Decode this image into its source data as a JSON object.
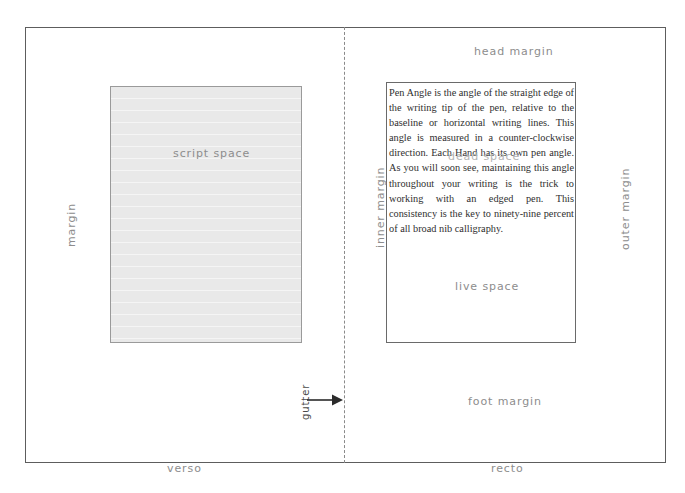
{
  "diagram": {
    "pages": {
      "verso_label": "verso",
      "recto_label": "recto"
    },
    "blocks": {
      "script_space_label": "script space",
      "live_space_label": "live space",
      "dead_space_label": "dead space"
    },
    "margins": {
      "head": "head margin",
      "foot": "foot margin",
      "inner": "inner margin",
      "outer": "outer margin",
      "verso_margin": "margin"
    },
    "gutter": {
      "label": "gutter",
      "arrow_icon": "arrow-right-icon"
    },
    "body_copy": "Pen Angle is the angle of the straight edge of the writing tip of the pen, relative to the baseline or horizontal writing lines. This angle is measured in a counter-clockwise direction. Each Hand has its own pen angle. As you will soon see, maintaining this angle throughout your writing is the trick to working with an edged pen. This consistency is the key to ninety-nine percent of all broad nib calligraphy.",
    "colors": {
      "frame_stroke": "#5d5d5d",
      "fold_line": "#8a8a8a",
      "script_space_fill": "#e9e9e9",
      "script_space_stroke": "#9a9a9a",
      "live_space_stroke": "#6a6a6a",
      "annotation_text": "#8d8d8d",
      "dead_space_text": "#b4b4b4",
      "body_text": "#2f2f2f",
      "page_background": "#ffffff"
    }
  }
}
